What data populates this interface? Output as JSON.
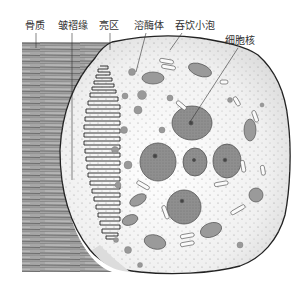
{
  "figure": {
    "labels": [
      {
        "id": "bone-matrix",
        "text": "骨质",
        "x": 25,
        "y": 20
      },
      {
        "id": "ruffled-border",
        "text": "皱褶缘",
        "x": 58,
        "y": 20
      },
      {
        "id": "clear-zone",
        "text": "亮区",
        "x": 99,
        "y": 20
      },
      {
        "id": "lysosome",
        "text": "溶酶体",
        "x": 134,
        "y": 20
      },
      {
        "id": "pinocytotic-vesicle",
        "text": "吞饮小泡",
        "x": 175,
        "y": 20
      },
      {
        "id": "nucleus",
        "text": "细胞核",
        "x": 225,
        "y": 35
      }
    ],
    "colors": {
      "bone": "#8a8a8a",
      "cytoplasm": "#f2f2f2",
      "nucleus": "#8c8c8c",
      "organelle": "#a8a8a8",
      "outline": "#222222"
    }
  }
}
